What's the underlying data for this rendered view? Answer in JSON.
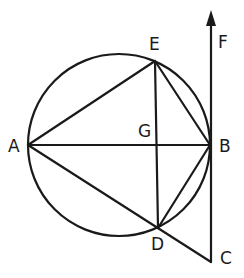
{
  "diagram": {
    "type": "geometry",
    "circle": {
      "center": [
        119,
        145
      ],
      "radius": 91
    },
    "points": {
      "A": {
        "label": "A",
        "x": 28,
        "y": 145,
        "label_x": 8,
        "label_y": 152
      },
      "B": {
        "label": "B",
        "x": 210,
        "y": 145,
        "label_x": 219,
        "label_y": 152
      },
      "E": {
        "label": "E",
        "x": 155,
        "y": 61,
        "label_x": 149,
        "label_y": 50
      },
      "D": {
        "label": "D",
        "x": 158,
        "y": 228,
        "label_x": 151,
        "label_y": 250
      },
      "G": {
        "label": "G",
        "x": 156,
        "y": 145,
        "label_x": 138,
        "label_y": 137
      },
      "C": {
        "label": "C",
        "x": 211,
        "y": 262,
        "label_x": 220,
        "label_y": 264
      },
      "F": {
        "label": "F",
        "x": 211,
        "y": 12,
        "label_x": 218,
        "label_y": 48
      }
    },
    "segments": [
      [
        "A",
        "B"
      ],
      [
        "A",
        "E"
      ],
      [
        "E",
        "B"
      ],
      [
        "E",
        "D"
      ],
      [
        "D",
        "B"
      ],
      [
        "A",
        "C"
      ],
      [
        "B",
        "C"
      ]
    ],
    "rays": [
      [
        "B",
        "F"
      ]
    ],
    "stroke_color": "#1a1a1a"
  }
}
